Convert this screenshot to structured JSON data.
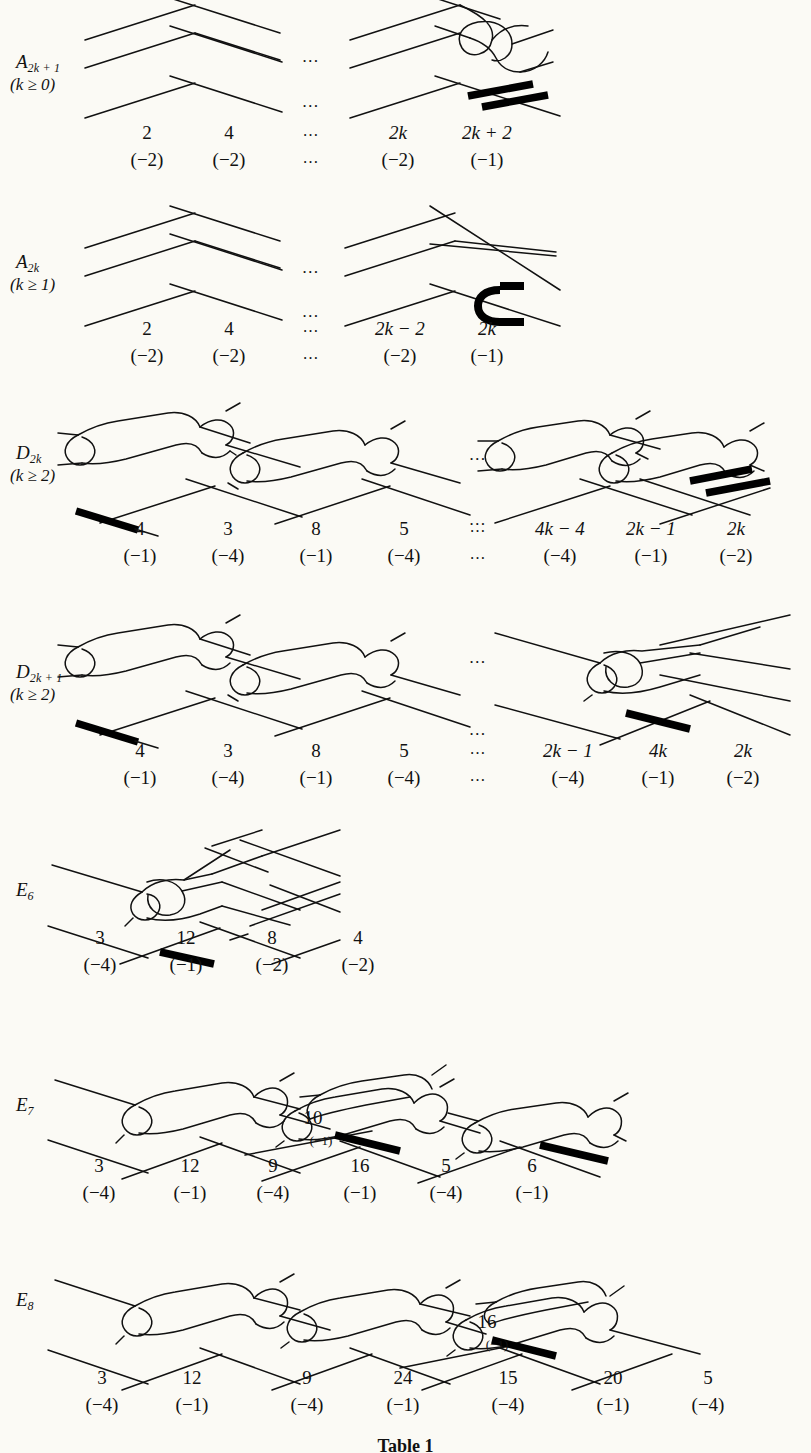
{
  "figure": {
    "caption": "Table 1",
    "background_color": "#fbfaf5",
    "ink_color": "#111111"
  },
  "rows": [
    {
      "id": "A-odd",
      "label_main": "A",
      "label_sub": "2k + 1",
      "label_condition": "(k ≥ 0)",
      "weights": [
        "2",
        "4",
        "…",
        "2k",
        "2k + 2"
      ],
      "multiplicities": [
        "(−2)",
        "(−2)",
        "…",
        "(−2)",
        "(−1)"
      ]
    },
    {
      "id": "A-even",
      "label_main": "A",
      "label_sub": "2k",
      "label_condition": "(k ≥ 1)",
      "weights": [
        "2",
        "4",
        "…",
        "2k − 2",
        "2k"
      ],
      "multiplicities": [
        "(−2)",
        "(−2)",
        "…",
        "(−2)",
        "(−1)"
      ]
    },
    {
      "id": "D-even",
      "label_main": "D",
      "label_sub": "2k",
      "label_condition": "(k ≥ 2)",
      "weights": [
        "4",
        "3",
        "8",
        "5",
        "…",
        "4k − 4",
        "2k − 1",
        "2k"
      ],
      "multiplicities": [
        "(−1)",
        "(−4)",
        "(−1)",
        "(−4)",
        "…",
        "(−4)",
        "(−1)",
        "(−2)"
      ]
    },
    {
      "id": "D-odd",
      "label_main": "D",
      "label_sub": "2k + 1",
      "label_condition": "(k ≥ 2)",
      "weights": [
        "4",
        "3",
        "8",
        "5",
        "…",
        "2k − 1",
        "4k",
        "2k"
      ],
      "multiplicities": [
        "(−1)",
        "(−4)",
        "(−1)",
        "(−4)",
        "…",
        "(−4)",
        "(−1)",
        "(−2)"
      ]
    },
    {
      "id": "E6",
      "label_main": "E",
      "label_sub": "6",
      "label_condition": "",
      "weights": [
        "3",
        "12",
        "8",
        "4"
      ],
      "multiplicities": [
        "(−4)",
        "(−1)",
        "(−2)",
        "(−2)"
      ]
    },
    {
      "id": "E7",
      "label_main": "E",
      "label_sub": "7",
      "label_condition": "",
      "weights": [
        "3",
        "12",
        "9",
        "16",
        "5",
        "6"
      ],
      "multiplicities": [
        "(−4)",
        "(−1)",
        "(−4)",
        "(−1)",
        "(−4)",
        "(−1)"
      ],
      "extra_node": {
        "weight": "10",
        "multiplicity": "(−1)"
      }
    },
    {
      "id": "E8",
      "label_main": "E",
      "label_sub": "8",
      "label_condition": "",
      "weights": [
        "3",
        "12",
        "9",
        "24",
        "15",
        "20",
        "5"
      ],
      "multiplicities": [
        "(−4)",
        "(−1)",
        "(−4)",
        "(−1)",
        "(−4)",
        "(−1)",
        "(−4)"
      ],
      "extra_node": {
        "weight": "16",
        "multiplicity": "(−1)"
      }
    }
  ],
  "ellipsis": "…"
}
